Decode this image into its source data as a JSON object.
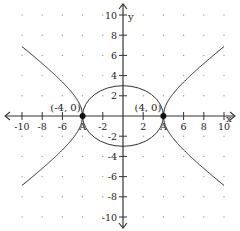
{
  "chart_data": {
    "type": "line",
    "title": "",
    "xlabel": "x",
    "ylabel": "y",
    "xlim": [
      -10,
      10
    ],
    "ylim": [
      -10,
      10
    ],
    "grid": "dots",
    "x_ticks": [
      -10,
      -8,
      -6,
      -4,
      -2,
      2,
      4,
      6,
      8,
      10
    ],
    "x_tick_labels": [
      "-10",
      "-8",
      "-6",
      "A",
      "-2",
      "2",
      "A",
      "6",
      "8",
      "10"
    ],
    "y_ticks": [
      -10,
      -8,
      -6,
      -4,
      -2,
      2,
      4,
      6,
      8,
      10
    ],
    "y_tick_labels": [
      "-10",
      "-8",
      "-6",
      "-4",
      "-2",
      "2",
      "4",
      "6",
      "8",
      "10"
    ],
    "series": [
      {
        "name": "ellipse",
        "equation": "x^2/16 + y^2/9 = 1",
        "center": [
          0,
          0
        ],
        "a": 4,
        "b": 3
      },
      {
        "name": "hyperbola",
        "equation": "x^2/16 - y^2/9 = 1",
        "vertices": [
          [
            -4,
            0
          ],
          [
            4,
            0
          ]
        ],
        "a": 4,
        "b": 3,
        "x_range": [
          -10,
          10
        ]
      }
    ],
    "points": [
      {
        "x": -4,
        "y": 0,
        "label": "(-4, 0)"
      },
      {
        "x": 4,
        "y": 0,
        "label": "(4, 0)"
      }
    ]
  },
  "axes": {
    "x_label": "x",
    "y_label": "y"
  },
  "labels": {
    "point_left": "(-4, 0)",
    "point_right": "(4, 0)"
  }
}
